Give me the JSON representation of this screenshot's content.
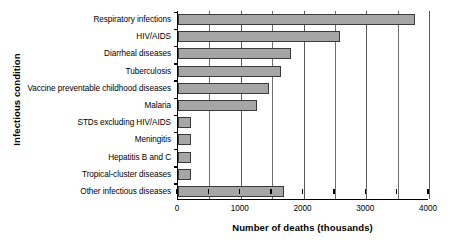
{
  "chart_data": {
    "type": "bar",
    "orientation": "horizontal",
    "title": "",
    "xlabel": "Number of deaths (thousands)",
    "ylabel": "Infectious condition",
    "xlim": [
      0,
      4000
    ],
    "xticks": [
      0,
      500,
      1000,
      1500,
      2000,
      2500,
      3000,
      3500,
      4000
    ],
    "xtick_labels": [
      "0",
      "",
      "1000",
      "",
      "2000",
      "",
      "3000",
      "",
      "4000"
    ],
    "grid": "vertical",
    "legend": "none",
    "categories": [
      "Respiratory infections",
      "HIV/AIDS",
      "Diarrheal diseases",
      "Tuberculosis",
      "Vaccine preventable childhood diseases",
      "Malaria",
      "STDs excluding HIV/AIDS",
      "Meningitis",
      "Hepatitis B and C",
      "Tropical-cluster diseases",
      "Other infectious diseases"
    ],
    "values": [
      3780,
      2580,
      1800,
      1640,
      1450,
      1260,
      210,
      200,
      200,
      200,
      1690
    ],
    "bar_color": "#a6a6a6",
    "bar_edge_color": "#3a3a3a",
    "axis_color": "#000000",
    "gridline_color": "#6f6f6f"
  }
}
